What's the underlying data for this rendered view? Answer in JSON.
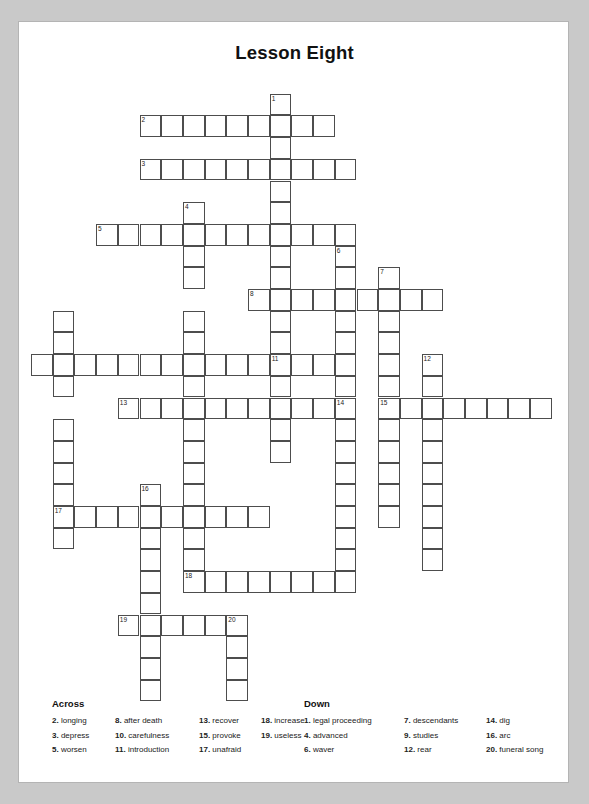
{
  "page": {
    "title": "Lesson Eight",
    "background": "#c9c9c9",
    "paper": "#ffffff",
    "grid_line_color": "#4d4d4d"
  },
  "grid": {
    "cell_size": 21.7,
    "origin_x": 12,
    "origin_y": 50,
    "note": "cells listed as [col,row]; number label optional",
    "cells": [
      {
        "c": 11,
        "r": 1,
        "n": "1"
      },
      {
        "c": 5,
        "r": 2,
        "n": "2"
      },
      {
        "c": 6,
        "r": 2
      },
      {
        "c": 7,
        "r": 2
      },
      {
        "c": 8,
        "r": 2
      },
      {
        "c": 9,
        "r": 2
      },
      {
        "c": 10,
        "r": 2
      },
      {
        "c": 11,
        "r": 2
      },
      {
        "c": 12,
        "r": 2
      },
      {
        "c": 13,
        "r": 2
      },
      {
        "c": 11,
        "r": 3
      },
      {
        "c": 5,
        "r": 4,
        "n": "3"
      },
      {
        "c": 6,
        "r": 4
      },
      {
        "c": 7,
        "r": 4
      },
      {
        "c": 8,
        "r": 4
      },
      {
        "c": 9,
        "r": 4
      },
      {
        "c": 10,
        "r": 4
      },
      {
        "c": 11,
        "r": 4
      },
      {
        "c": 12,
        "r": 4
      },
      {
        "c": 13,
        "r": 4
      },
      {
        "c": 14,
        "r": 4
      },
      {
        "c": 11,
        "r": 5
      },
      {
        "c": 7,
        "r": 6,
        "n": "4"
      },
      {
        "c": 11,
        "r": 6
      },
      {
        "c": 3,
        "r": 7,
        "n": "5"
      },
      {
        "c": 4,
        "r": 7
      },
      {
        "c": 5,
        "r": 7
      },
      {
        "c": 6,
        "r": 7
      },
      {
        "c": 7,
        "r": 7
      },
      {
        "c": 8,
        "r": 7
      },
      {
        "c": 9,
        "r": 7
      },
      {
        "c": 10,
        "r": 7
      },
      {
        "c": 11,
        "r": 7
      },
      {
        "c": 12,
        "r": 7
      },
      {
        "c": 13,
        "r": 7
      },
      {
        "c": 14,
        "r": 7
      },
      {
        "c": 7,
        "r": 8
      },
      {
        "c": 11,
        "r": 8
      },
      {
        "c": 14,
        "r": 8,
        "n": "6"
      },
      {
        "c": 7,
        "r": 9
      },
      {
        "c": 11,
        "r": 9
      },
      {
        "c": 14,
        "r": 9
      },
      {
        "c": 16,
        "r": 9,
        "n": "7"
      },
      {
        "c": 10,
        "r": 10,
        "n": "8"
      },
      {
        "c": 11,
        "r": 10
      },
      {
        "c": 12,
        "r": 10
      },
      {
        "c": 13,
        "r": 10
      },
      {
        "c": 14,
        "r": 10
      },
      {
        "c": 15,
        "r": 10
      },
      {
        "c": 16,
        "r": 10
      },
      {
        "c": 17,
        "r": 10
      },
      {
        "c": 18,
        "r": 10
      },
      {
        "c": 1,
        "r": 11
      },
      {
        "c": 7,
        "r": 11
      },
      {
        "c": 11,
        "r": 11
      },
      {
        "c": 14,
        "r": 11
      },
      {
        "c": 16,
        "r": 11
      },
      {
        "c": 1,
        "r": 12
      },
      {
        "c": 7,
        "r": 12
      },
      {
        "c": 11,
        "r": 12
      },
      {
        "c": 14,
        "r": 12
      },
      {
        "c": 16,
        "r": 12
      },
      {
        "c": 0,
        "r": 13
      },
      {
        "c": 1,
        "r": 13
      },
      {
        "c": 2,
        "r": 13
      },
      {
        "c": 3,
        "r": 13
      },
      {
        "c": 4,
        "r": 13
      },
      {
        "c": 5,
        "r": 13
      },
      {
        "c": 6,
        "r": 13
      },
      {
        "c": 7,
        "r": 13
      },
      {
        "c": 8,
        "r": 13
      },
      {
        "c": 9,
        "r": 13
      },
      {
        "c": 10,
        "r": 13
      },
      {
        "c": 11,
        "r": 13,
        "n": "11"
      },
      {
        "c": 12,
        "r": 13
      },
      {
        "c": 13,
        "r": 13
      },
      {
        "c": 14,
        "r": 13
      },
      {
        "c": 16,
        "r": 13
      },
      {
        "c": 18,
        "r": 13,
        "n": "12"
      },
      {
        "c": 1,
        "r": 14
      },
      {
        "c": 7,
        "r": 14
      },
      {
        "c": 11,
        "r": 14
      },
      {
        "c": 14,
        "r": 14
      },
      {
        "c": 16,
        "r": 14
      },
      {
        "c": 18,
        "r": 14
      },
      {
        "c": 4,
        "r": 15,
        "n": "13"
      },
      {
        "c": 5,
        "r": 15
      },
      {
        "c": 6,
        "r": 15
      },
      {
        "c": 7,
        "r": 15
      },
      {
        "c": 8,
        "r": 15
      },
      {
        "c": 9,
        "r": 15
      },
      {
        "c": 10,
        "r": 15
      },
      {
        "c": 11,
        "r": 15
      },
      {
        "c": 12,
        "r": 15
      },
      {
        "c": 13,
        "r": 15
      },
      {
        "c": 14,
        "r": 15,
        "n": "14"
      },
      {
        "c": 16,
        "r": 15,
        "n": "15"
      },
      {
        "c": 17,
        "r": 15
      },
      {
        "c": 18,
        "r": 15
      },
      {
        "c": 19,
        "r": 15
      },
      {
        "c": 20,
        "r": 15
      },
      {
        "c": 21,
        "r": 15
      },
      {
        "c": 22,
        "r": 15
      },
      {
        "c": 23,
        "r": 15
      },
      {
        "c": 1,
        "r": 16
      },
      {
        "c": 7,
        "r": 16
      },
      {
        "c": 11,
        "r": 16
      },
      {
        "c": 14,
        "r": 16
      },
      {
        "c": 16,
        "r": 16
      },
      {
        "c": 18,
        "r": 16
      },
      {
        "c": 1,
        "r": 17
      },
      {
        "c": 7,
        "r": 17
      },
      {
        "c": 11,
        "r": 17
      },
      {
        "c": 14,
        "r": 17
      },
      {
        "c": 16,
        "r": 17
      },
      {
        "c": 18,
        "r": 17
      },
      {
        "c": 1,
        "r": 18
      },
      {
        "c": 7,
        "r": 18
      },
      {
        "c": 14,
        "r": 18
      },
      {
        "c": 16,
        "r": 18
      },
      {
        "c": 18,
        "r": 18
      },
      {
        "c": 1,
        "r": 19
      },
      {
        "c": 5,
        "r": 19,
        "n": "16"
      },
      {
        "c": 7,
        "r": 19
      },
      {
        "c": 14,
        "r": 19
      },
      {
        "c": 16,
        "r": 19
      },
      {
        "c": 18,
        "r": 19
      },
      {
        "c": 1,
        "r": 20,
        "n": "17"
      },
      {
        "c": 2,
        "r": 20
      },
      {
        "c": 3,
        "r": 20
      },
      {
        "c": 4,
        "r": 20
      },
      {
        "c": 5,
        "r": 20
      },
      {
        "c": 6,
        "r": 20
      },
      {
        "c": 7,
        "r": 20
      },
      {
        "c": 8,
        "r": 20
      },
      {
        "c": 9,
        "r": 20
      },
      {
        "c": 10,
        "r": 20
      },
      {
        "c": 14,
        "r": 20
      },
      {
        "c": 16,
        "r": 20
      },
      {
        "c": 18,
        "r": 20
      },
      {
        "c": 1,
        "r": 21
      },
      {
        "c": 5,
        "r": 21
      },
      {
        "c": 7,
        "r": 21
      },
      {
        "c": 14,
        "r": 21
      },
      {
        "c": 18,
        "r": 21
      },
      {
        "c": 5,
        "r": 22
      },
      {
        "c": 7,
        "r": 22
      },
      {
        "c": 14,
        "r": 22
      },
      {
        "c": 18,
        "r": 22
      },
      {
        "c": 5,
        "r": 23
      },
      {
        "c": 7,
        "r": 23,
        "n": "18"
      },
      {
        "c": 8,
        "r": 23
      },
      {
        "c": 9,
        "r": 23
      },
      {
        "c": 10,
        "r": 23
      },
      {
        "c": 11,
        "r": 23
      },
      {
        "c": 12,
        "r": 23
      },
      {
        "c": 13,
        "r": 23
      },
      {
        "c": 14,
        "r": 23
      },
      {
        "c": 5,
        "r": 24
      },
      {
        "c": 4,
        "r": 25,
        "n": "19"
      },
      {
        "c": 5,
        "r": 25
      },
      {
        "c": 6,
        "r": 25
      },
      {
        "c": 7,
        "r": 25
      },
      {
        "c": 8,
        "r": 25
      },
      {
        "c": 9,
        "r": 25,
        "n": "20"
      },
      {
        "c": 5,
        "r": 26
      },
      {
        "c": 9,
        "r": 26
      },
      {
        "c": 5,
        "r": 27
      },
      {
        "c": 9,
        "r": 27
      },
      {
        "c": 5,
        "r": 28
      },
      {
        "c": 9,
        "r": 28
      }
    ]
  },
  "clues": {
    "across": {
      "heading": "Across",
      "columns": [
        [
          {
            "num": "2.",
            "text": "longing"
          },
          {
            "num": "3.",
            "text": "depress"
          },
          {
            "num": "5.",
            "text": "worsen"
          }
        ],
        [
          {
            "num": "8.",
            "text": "after death"
          },
          {
            "num": "10.",
            "text": "carefulness"
          },
          {
            "num": "11.",
            "text": "introduction"
          }
        ],
        [
          {
            "num": "13.",
            "text": "recover"
          },
          {
            "num": "15.",
            "text": "provoke"
          },
          {
            "num": "17.",
            "text": "unafraid"
          }
        ],
        [
          {
            "num": "18.",
            "text": "increase"
          },
          {
            "num": "19.",
            "text": "useless"
          }
        ]
      ]
    },
    "down": {
      "heading": "Down",
      "columns": [
        [
          {
            "num": "1.",
            "text": "legal proceeding"
          },
          {
            "num": "4.",
            "text": "advanced"
          },
          {
            "num": "6.",
            "text": "waver"
          }
        ],
        [
          {
            "num": "7.",
            "text": "descendants"
          },
          {
            "num": "9.",
            "text": "studies"
          },
          {
            "num": "12.",
            "text": "rear"
          }
        ],
        [
          {
            "num": "14.",
            "text": "dig"
          },
          {
            "num": "16.",
            "text": "arc"
          },
          {
            "num": "20.",
            "text": "funeral song"
          }
        ]
      ]
    }
  }
}
